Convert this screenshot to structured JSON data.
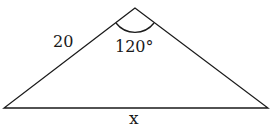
{
  "diagram": {
    "type": "triangle",
    "side_label": "20",
    "angle_label": "120°",
    "base_label": "x",
    "stroke_color": "#1a1a1a",
    "background": "#ffffff"
  }
}
